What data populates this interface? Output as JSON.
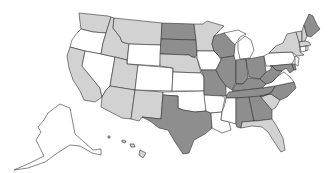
{
  "map": {
    "title": "United States choropleth map",
    "legend_shown": false,
    "colors": {
      "none": "#ffffff",
      "light": "#d2d2d2",
      "dark": "#8e8e8e",
      "border": "#333333"
    },
    "states": {
      "WA": "light",
      "OR": "none",
      "CA": "light",
      "NV": "none",
      "ID": "light",
      "MT": "light",
      "WY": "none",
      "UT": "light",
      "AZ": "light",
      "CO": "none",
      "NM": "light",
      "ND": "dark",
      "SD": "dark",
      "NE": "light",
      "KS": "none",
      "OK": "none",
      "TX": "dark",
      "MN": "light",
      "IA": "none",
      "MO": "dark",
      "AR": "none",
      "LA": "none",
      "WI": "dark",
      "IL": "dark",
      "MS": "none",
      "MI": "none",
      "IN": "dark",
      "KY": "dark",
      "TN": "dark",
      "AL": "dark",
      "OH": "dark",
      "GA": "dark",
      "FL": "light",
      "SC": "light",
      "NC": "dark",
      "VA": "none",
      "WV": "dark",
      "PA": "none",
      "NY": "light",
      "ME": "dark",
      "VT": "light",
      "NH": "light",
      "MA": "light",
      "NJ": "none",
      "MD": "dark",
      "DE": "dark",
      "AK": "none",
      "HI": "light"
    }
  }
}
